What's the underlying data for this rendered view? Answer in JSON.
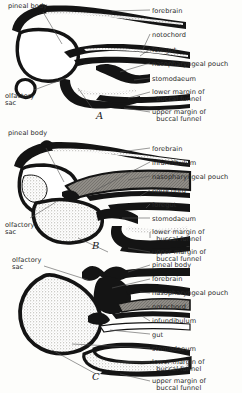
{
  "figure": {
    "background_color": "#fdfdfb",
    "ink_color": "#111111",
    "stipple_color": "#b8b5ae",
    "leader_color": "#555555"
  },
  "panels": [
    {
      "id": "A",
      "letter": "A",
      "letter_pos": {
        "x": 96,
        "y": 110
      },
      "left_labels": [
        {
          "key": "pineal_body",
          "text": "pineal body",
          "x": 8,
          "y": 3
        },
        {
          "key": "olfactory_sac",
          "text": "olfactory\nsac",
          "x": 5,
          "y": 93
        }
      ],
      "right_labels": [
        {
          "key": "forebrain",
          "text": "forebrain",
          "x": 152,
          "y": 8
        },
        {
          "key": "notochord",
          "text": "notochord",
          "x": 152,
          "y": 32
        },
        {
          "key": "foregut",
          "text": "foregut",
          "x": 152,
          "y": 47
        },
        {
          "key": "nasopharyngeal_pouch",
          "text": "nasopharyngeal pouch",
          "x": 152,
          "y": 61
        },
        {
          "key": "stomodaeum",
          "text": "stomodaeum",
          "x": 152,
          "y": 76
        },
        {
          "key": "lower_margin_buccal_funnel",
          "text": "lower margin of\n  buccal funnel",
          "x": 152,
          "y": 89
        },
        {
          "key": "upper_margin_buccal_funnel",
          "text": "upper margin of\n  buccal funnel",
          "x": 152,
          "y": 109
        }
      ]
    },
    {
      "id": "B",
      "letter": "B",
      "letter_pos": {
        "x": 92,
        "y": 240
      },
      "left_labels": [
        {
          "key": "pineal_body",
          "text": "pineal body",
          "x": 8,
          "y": 130
        },
        {
          "key": "olfactory_sac",
          "text": "olfactory\nsac",
          "x": 5,
          "y": 222
        }
      ],
      "right_labels": [
        {
          "key": "forebrain",
          "text": "forebrain",
          "x": 152,
          "y": 146
        },
        {
          "key": "infundibulum",
          "text": "infundibulum",
          "x": 152,
          "y": 160
        },
        {
          "key": "nasopharyngeal_pouch",
          "text": "nasopharyngeal pouch",
          "x": 152,
          "y": 174
        },
        {
          "key": "notochord",
          "text": "notochord",
          "x": 152,
          "y": 188
        },
        {
          "key": "foregut",
          "text": "foregut",
          "x": 152,
          "y": 202
        },
        {
          "key": "stomodaeum",
          "text": "stomodaeum",
          "x": 152,
          "y": 216
        },
        {
          "key": "lower_margin_buccal_funnel",
          "text": "lower margin of\n  buccal funnel",
          "x": 152,
          "y": 229
        },
        {
          "key": "upper_margin_buccal_funnel",
          "text": "upper margin of\n  buccal funnel",
          "x": 152,
          "y": 249
        }
      ]
    },
    {
      "id": "C",
      "letter": "C",
      "letter_pos": {
        "x": 92,
        "y": 371
      },
      "left_labels": [
        {
          "key": "olfactory_sac",
          "text": "olfactory\nsac",
          "x": 12,
          "y": 257
        }
      ],
      "right_labels": [
        {
          "key": "pineal_body",
          "text": "pineal body",
          "x": 152,
          "y": 262
        },
        {
          "key": "forebrain",
          "text": "forebrain",
          "x": 152,
          "y": 276
        },
        {
          "key": "nasopharyngeal_pouch",
          "text": "nasopharyngeal pouch",
          "x": 152,
          "y": 290
        },
        {
          "key": "notochord",
          "text": "notochord",
          "x": 152,
          "y": 304
        },
        {
          "key": "infundibulum",
          "text": "infundibulum",
          "x": 152,
          "y": 318
        },
        {
          "key": "gut",
          "text": "gut",
          "x": 152,
          "y": 332
        },
        {
          "key": "stomodaeum",
          "text": "stomodaeum",
          "x": 152,
          "y": 346
        },
        {
          "key": "lower_margin_buccal_funnel",
          "text": "lower margin of\n  buccal funnel",
          "x": 152,
          "y": 359
        },
        {
          "key": "upper_margin_buccal_funnel",
          "text": "upper margin of\n  buccal funnel",
          "x": 152,
          "y": 378
        }
      ]
    }
  ]
}
